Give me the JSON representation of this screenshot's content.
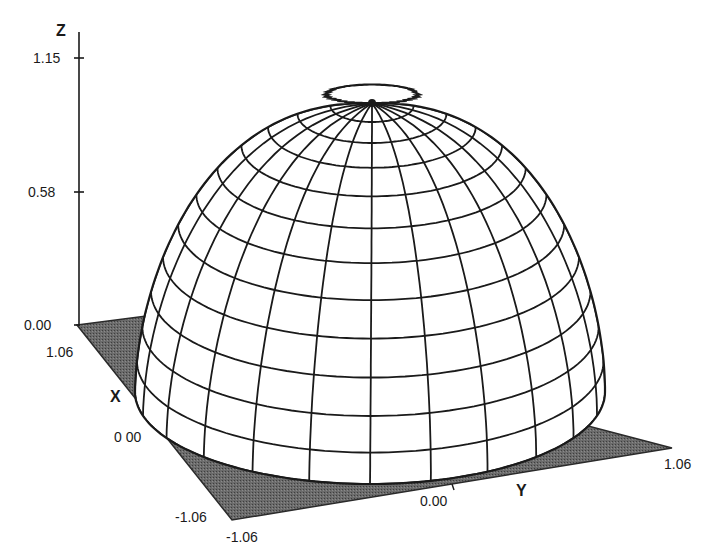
{
  "chart_data": {
    "type": "surface3d",
    "title": "",
    "axes": {
      "z": {
        "label": "Z",
        "ticks": [
          "0.00",
          "0.58",
          "1.15"
        ],
        "range": [
          0.0,
          1.15
        ]
      },
      "x": {
        "label": "X",
        "ticks": [
          "1.06",
          "0.00",
          "-1.06"
        ],
        "range": [
          -1.06,
          1.06
        ]
      },
      "y": {
        "label": "Y",
        "ticks": [
          "-1.06",
          "0.00",
          "1.06"
        ],
        "range": [
          -1.06,
          1.06
        ]
      }
    },
    "surface": {
      "peak_z": 1.15,
      "peak_xy": [
        0.0,
        0.0
      ],
      "base_z": 0.0,
      "meridians": 24,
      "parallels": 12,
      "fill": "#ffffff",
      "line_color": "#1a1a1a"
    },
    "base_plane": {
      "z": 0.0,
      "fill": "#5a5a5a",
      "extent": [
        -1.06,
        1.06
      ]
    },
    "grid": false,
    "legend": null
  },
  "labels": {
    "z_axis": "Z",
    "z_tick_top": "1.15",
    "z_tick_mid": "0.58",
    "z_tick_zero": "0.00",
    "x_axis": "X",
    "x_tick_pos": "1.06",
    "x_tick_zero": "0 00",
    "x_tick_neg": "-1.06",
    "y_axis": "Y",
    "y_tick_neg": "-1.06",
    "y_tick_zero": "0.00",
    "y_tick_pos": "1.06"
  }
}
